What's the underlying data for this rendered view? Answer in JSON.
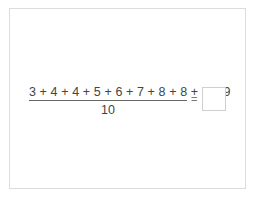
{
  "problem": {
    "numerator": "3 + 4 + 4 + 5 + 6 + 7 + 8 + 8 + 8 + 9",
    "denominator": "10",
    "equals": "=",
    "answer_value": ""
  }
}
